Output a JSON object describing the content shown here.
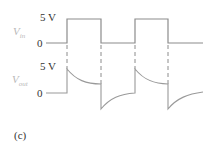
{
  "figure": {
    "panel_label": "(c)",
    "vin": {
      "name": "V",
      "subscript": "in",
      "high_label": "5 V",
      "zero_label": "0"
    },
    "vout": {
      "name": "V",
      "subscript": "out",
      "high_label": "5 V",
      "zero_label": "0"
    },
    "colors": {
      "waveform": "#8c8c8c",
      "dashed": "#8c8c8c",
      "label_dark": "#333333",
      "label_light": "#b8b8b8"
    }
  }
}
